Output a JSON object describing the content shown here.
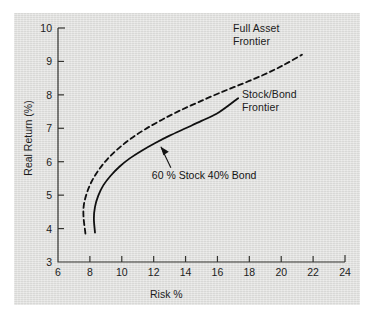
{
  "chart_data": {
    "type": "line",
    "title": "",
    "xlabel": "Risk %",
    "ylabel": "Real Return (%)",
    "xlim": [
      6,
      24
    ],
    "ylim": [
      3,
      10
    ],
    "xticks": [
      6,
      8,
      10,
      12,
      14,
      16,
      18,
      20,
      22,
      24
    ],
    "yticks": [
      3,
      4,
      5,
      6,
      7,
      8,
      9,
      10
    ],
    "grid": false,
    "legend_position": "inline-annotations",
    "line_color": "#101010",
    "series": [
      {
        "name": "Full Asset Frontier",
        "style": "dashed",
        "label_lines": [
          "Full Asset",
          "Frontier"
        ],
        "points": [
          [
            7.72,
            3.85
          ],
          [
            7.6,
            4.35
          ],
          [
            7.62,
            4.7
          ],
          [
            7.8,
            5.05
          ],
          [
            8.1,
            5.4
          ],
          [
            8.55,
            5.75
          ],
          [
            9.1,
            6.08
          ],
          [
            9.8,
            6.4
          ],
          [
            10.6,
            6.7
          ],
          [
            11.5,
            6.98
          ],
          [
            12.5,
            7.25
          ],
          [
            13.6,
            7.52
          ],
          [
            14.8,
            7.78
          ],
          [
            16.1,
            8.05
          ],
          [
            17.5,
            8.32
          ],
          [
            18.9,
            8.6
          ],
          [
            20.1,
            8.88
          ],
          [
            21.3,
            9.2
          ]
        ]
      },
      {
        "name": "Stock/Bond Frontier",
        "style": "solid",
        "label_lines": [
          "Stock/Bond",
          "Frontier"
        ],
        "points": [
          [
            8.32,
            3.88
          ],
          [
            8.25,
            4.3
          ],
          [
            8.32,
            4.65
          ],
          [
            8.52,
            4.98
          ],
          [
            8.85,
            5.3
          ],
          [
            9.3,
            5.58
          ],
          [
            9.85,
            5.85
          ],
          [
            10.5,
            6.1
          ],
          [
            11.25,
            6.33
          ],
          [
            12.1,
            6.56
          ],
          [
            13.0,
            6.78
          ],
          [
            14.0,
            7.0
          ],
          [
            15.0,
            7.22
          ],
          [
            16.1,
            7.48
          ],
          [
            17.3,
            7.9
          ]
        ]
      }
    ],
    "annotations": [
      {
        "name": "60-40-callout",
        "lines": [
          "60 % Stock",
          "40% Bond"
        ],
        "text_x": 12.2,
        "text_y": 5.55,
        "arrow_to_x": 12.45,
        "arrow_to_y": 6.45
      }
    ]
  }
}
